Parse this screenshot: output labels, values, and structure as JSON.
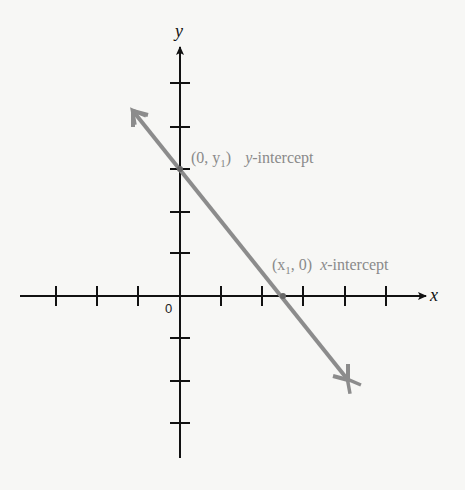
{
  "diagram": {
    "axes": {
      "x_label": "x",
      "y_label": "y",
      "origin_label": "0",
      "x_ticks": [
        -3,
        -2,
        -1,
        1,
        2,
        3,
        4,
        5
      ],
      "y_ticks": [
        -1,
        -2,
        -3,
        1,
        2,
        3,
        4,
        5
      ]
    },
    "line": {
      "description": "line with negative slope, arrows at both ends",
      "color": "#8c8c8c"
    },
    "annotations": {
      "y_intercept_point": "(0, y",
      "y_intercept_sub": "1",
      "y_intercept_close": ")",
      "y_intercept_var": "y",
      "y_intercept_text": "-intercept",
      "x_intercept_open": "(x",
      "x_intercept_sub": "1",
      "x_intercept_rest": ", 0)",
      "x_intercept_var": "x",
      "x_intercept_text": "-intercept"
    },
    "colors": {
      "axis": "#111111",
      "line": "#8c8c8c",
      "annotation": "#8a8a8a"
    }
  }
}
